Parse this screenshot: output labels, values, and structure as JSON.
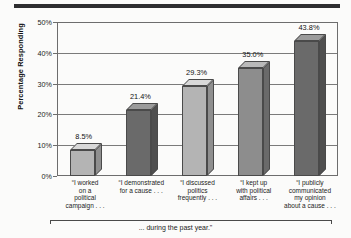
{
  "chart_data": {
    "type": "bar",
    "title": "",
    "subtitle": "",
    "xlabel": "... during the past year.\"",
    "ylabel": "Percentage Responding",
    "ylim": [
      0,
      50
    ],
    "ytick_labels": [
      "0%",
      "10%",
      "20%",
      "30%",
      "40%",
      "50%"
    ],
    "ytick_values": [
      0,
      10,
      20,
      30,
      40,
      50
    ],
    "grid": true,
    "legend": "none",
    "categories": [
      "“I worked\non a\npolitical\ncampaign . . .",
      "“I demonstrated\nfor a cause . . .",
      "“I discussed\npolitics\nfrequently . . .",
      "“I kept up\nwith political\naffairs . . .",
      "“I publicly\ncommunicated\nmy opinion\nabout a cause . . ."
    ],
    "values": [
      8.5,
      21.4,
      29.3,
      35.0,
      43.8
    ],
    "data_labels": [
      "8.5%",
      "21.4%",
      "29.3%",
      "35.0%",
      "43.8%"
    ],
    "bar_shades": [
      "light",
      "dark",
      "light",
      "mid",
      "dark"
    ],
    "colors": {
      "light_face": "#b4b4b4",
      "dark_face": "#6a6a6a",
      "mid_face": "#8d8d8d",
      "axis": "#6d6d6d",
      "rule": "#2e2e30",
      "text": "#1b1b1b",
      "background": "#fbfbfa"
    }
  },
  "labels": {
    "y_axis_title": "Percentage Responding",
    "bottom_caption": "... during the past year.\"",
    "cat_1_line_1": "“I worked",
    "cat_1_line_2": "on a",
    "cat_1_line_3": "political",
    "cat_1_line_4": "campaign . . .",
    "cat_2_line_1": "“I demonstrated",
    "cat_2_line_2": "for a cause . . .",
    "cat_3_line_1": "“I discussed",
    "cat_3_line_2": "politics",
    "cat_3_line_3": "frequently . . .",
    "cat_4_line_1": "“I kept up",
    "cat_4_line_2": "with political",
    "cat_4_line_3": "affairs . . .",
    "cat_5_line_1": "“I publicly",
    "cat_5_line_2": "communicated",
    "cat_5_line_3": "my opinion",
    "cat_5_line_4": "about a cause . . ."
  }
}
